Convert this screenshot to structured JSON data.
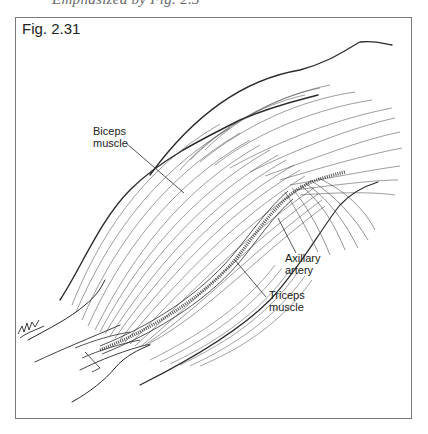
{
  "page": {
    "cutoff_caption": "Emphasized by Fig. 2.3"
  },
  "figure": {
    "label": "Fig. 2.31",
    "colors": {
      "ink": "#2a2a2a",
      "frame": "#7a7a7a",
      "background": "#ffffff"
    },
    "annotations": [
      {
        "id": "biceps",
        "line1": "Biceps",
        "line2": "muscle"
      },
      {
        "id": "axillary",
        "line1": "Axillary",
        "line2": "artery"
      },
      {
        "id": "triceps",
        "line1": "Triceps",
        "line2": "muscle"
      }
    ],
    "signature": "artist-signature"
  }
}
